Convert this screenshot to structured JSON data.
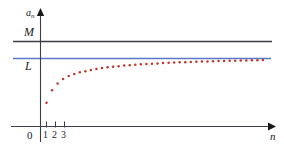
{
  "chart_data": {
    "type": "scatter",
    "title": "",
    "subtitle": "",
    "xlabel": "n",
    "ylabel": "a_n",
    "xlim": [
      0,
      40
    ],
    "ylim": [
      0,
      1.25
    ],
    "grid": false,
    "legend_position": "none",
    "annotations": [
      {
        "name": "upper-bound-M",
        "label": "M",
        "value": 1.12,
        "style": "solid horizontal line",
        "color": "#3c3c46"
      },
      {
        "name": "limit-L",
        "label": "L",
        "value": 0.86,
        "style": "solid horizontal line",
        "color": "#5b78c8"
      }
    ],
    "axis_labels": {
      "y_axis": "a",
      "y_axis_subscript": "n",
      "x_axis": "n",
      "origin": "0"
    },
    "x_tick_labels": [
      "1",
      "2",
      "3"
    ],
    "x_tick_values": [
      1,
      2,
      3
    ],
    "series": [
      {
        "name": "a_n",
        "marker": "dot",
        "color": "#c0392b",
        "x": [
          1,
          2,
          3,
          4,
          5,
          6,
          7,
          8,
          9,
          10,
          11,
          12,
          13,
          14,
          15,
          16,
          17,
          18,
          19,
          20,
          21,
          22,
          23,
          24,
          25,
          26,
          27,
          28,
          29,
          30,
          31,
          32,
          33,
          34,
          35,
          36,
          37,
          38,
          39,
          40
        ],
        "y": [
          0.3,
          0.46,
          0.545,
          0.6,
          0.64,
          0.665,
          0.685,
          0.7,
          0.715,
          0.728,
          0.739,
          0.748,
          0.756,
          0.763,
          0.77,
          0.776,
          0.781,
          0.786,
          0.79,
          0.794,
          0.798,
          0.802,
          0.805,
          0.808,
          0.811,
          0.814,
          0.816,
          0.819,
          0.821,
          0.823,
          0.825,
          0.827,
          0.829,
          0.831,
          0.833,
          0.834,
          0.836,
          0.837,
          0.839,
          0.84
        ]
      }
    ]
  },
  "figure": {
    "background_color": "#ffffff",
    "axis_color": "#3c3c46",
    "bound_line_color": "#3c3c46",
    "limit_line_color": "#5b78c8",
    "point_color": "#c0392b"
  }
}
